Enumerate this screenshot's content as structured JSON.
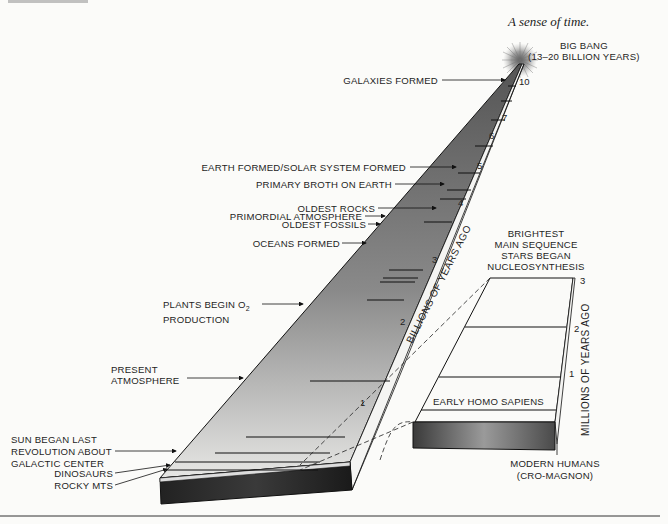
{
  "caption": "A sense of time.",
  "big_bang": {
    "line1": "BIG BANG",
    "line2": "(13–20 BILLION YEARS)"
  },
  "main_column": {
    "axis_label": "BILLIONS OF YEARS AGO",
    "ticks": [
      "10",
      "7",
      "6",
      "5",
      "4",
      "3",
      "2",
      "1"
    ],
    "events": [
      {
        "label": "GALAXIES FORMED"
      },
      {
        "label": "EARTH FORMED/SOLAR SYSTEM FORMED"
      },
      {
        "label": "PRIMARY BROTH ON EARTH"
      },
      {
        "label": "OLDEST ROCKS"
      },
      {
        "label": "PRIMORDIAL ATMOSPHERE"
      },
      {
        "label": "OLDEST FOSSILS"
      },
      {
        "label": "OCEANS FORMED"
      },
      {
        "label_line1": "PLANTS BEGIN O",
        "subscript": "2",
        "label_line2": "PRODUCTION"
      },
      {
        "label_line1": "PRESENT",
        "label_line2": "ATMOSPHERE"
      },
      {
        "label_line1": "SUN BEGAN LAST",
        "label_line2": "REVOLUTION ABOUT",
        "label_line3": "GALACTIC CENTER"
      },
      {
        "label": "DINOSAURS"
      },
      {
        "label": "ROCKY MTS"
      }
    ]
  },
  "inset_column": {
    "axis_label": "MILLIONS OF YEARS AGO",
    "ticks": [
      "3",
      "2",
      "1"
    ],
    "top_label": [
      "BRIGHTEST",
      "MAIN SEQUENCE",
      "STARS BEGAN",
      "NUCLEOSYNTHESIS"
    ],
    "events": [
      {
        "label": "EARLY HOMO SAPIENS"
      }
    ],
    "bottom_label": [
      "MODERN HUMANS",
      "(CRO-MAGNON)"
    ]
  }
}
